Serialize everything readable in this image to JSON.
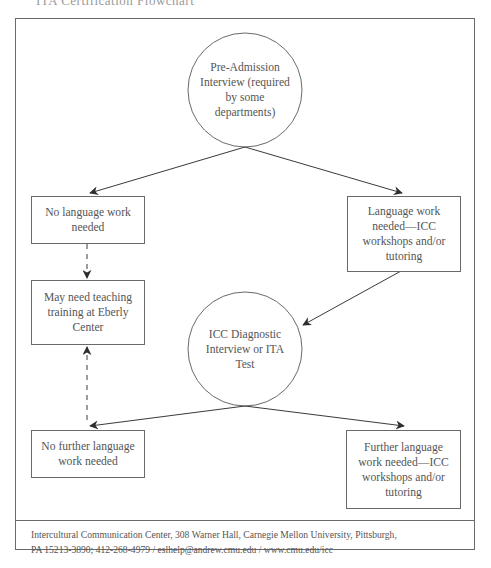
{
  "page": {
    "cut_heading": "ITA Certification Flowchart"
  },
  "diagram": {
    "nodes": {
      "pre_admission": {
        "shape": "circle",
        "label": "Pre-Admission Interview (required by some departments)"
      },
      "no_language_work": {
        "shape": "box",
        "label": "No language work needed"
      },
      "language_work_needed": {
        "shape": "box",
        "label": "Language work needed—ICC workshops and/or tutoring"
      },
      "teaching_training": {
        "shape": "box",
        "label": "May need teaching training at Eberly Center"
      },
      "icc_diagnostic": {
        "shape": "circle",
        "label": "ICC Diagnostic Interview or ITA Test"
      },
      "no_further_work": {
        "shape": "box",
        "label": "No further language work needed"
      },
      "further_work_needed": {
        "shape": "box",
        "label": "Further language work needed—ICC workshops and/or tutoring"
      }
    },
    "edges": [
      {
        "from": "pre_admission",
        "to": "no_language_work",
        "style": "solid"
      },
      {
        "from": "pre_admission",
        "to": "language_work_needed",
        "style": "solid"
      },
      {
        "from": "no_language_work",
        "to": "teaching_training",
        "style": "dashed"
      },
      {
        "from": "language_work_needed",
        "to": "icc_diagnostic",
        "style": "solid"
      },
      {
        "from": "icc_diagnostic",
        "to": "no_further_work",
        "style": "solid"
      },
      {
        "from": "icc_diagnostic",
        "to": "further_work_needed",
        "style": "solid"
      },
      {
        "from": "no_further_work",
        "to": "teaching_training",
        "style": "dashed"
      }
    ],
    "line_color": "#3a3a3a",
    "border_color": "#6a6a6a"
  },
  "footer": {
    "line1": "Intercultural Communication Center, 308 Warner Hall, Carnegie Mellon University, Pittsburgh,",
    "line2": "PA 15213-3890; 412-268-4979 / eslhelp@andrew.cmu.edu / www.cmu.edu/icc"
  }
}
